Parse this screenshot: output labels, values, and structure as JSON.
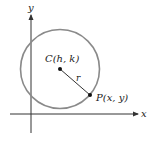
{
  "diagram": {
    "type": "circle-on-coordinate-plane",
    "axes": {
      "x_label": "x",
      "y_label": "y",
      "color": "#333333"
    },
    "circle": {
      "center_label": "C(h, k)",
      "radius_label": "r",
      "stroke_color": "#8a8a8a"
    },
    "point": {
      "label": "P(x, y)"
    },
    "point_color": "#111111"
  }
}
